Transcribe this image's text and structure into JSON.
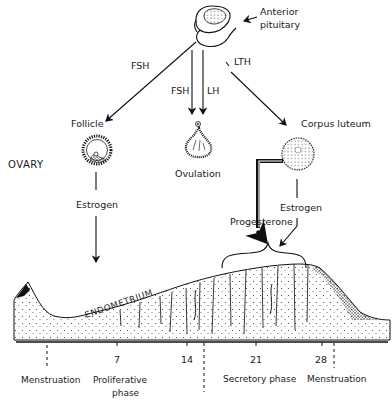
{
  "labels": {
    "anterior_pituitary": [
      "Anterior",
      "pituitary"
    ],
    "fsh_left": "FSH",
    "fsh_center": "FSH",
    "lh_center": "LH",
    "lth": "LTH",
    "follicle": "Follicle",
    "ovulation": "Ovulation",
    "corpus_luteum": "Corpus luteum",
    "ovary": "OVARY",
    "estrogen_left": "Estrogen",
    "estrogen_right": "Estrogen",
    "progesterone": "Progesterone",
    "endometrium": "ENDOMETRIUM"
  },
  "timeline": {
    "ticks": [
      "7",
      "14",
      "21",
      "28"
    ],
    "phases": {
      "menstruation_start": "Menstruation",
      "proliferative": [
        "Proliferative",
        "phase"
      ],
      "secretory": "Secretory phase",
      "menstruation_end": "Menstruation"
    }
  },
  "colors": {
    "ink": "#111111",
    "background": "#ffffff"
  }
}
